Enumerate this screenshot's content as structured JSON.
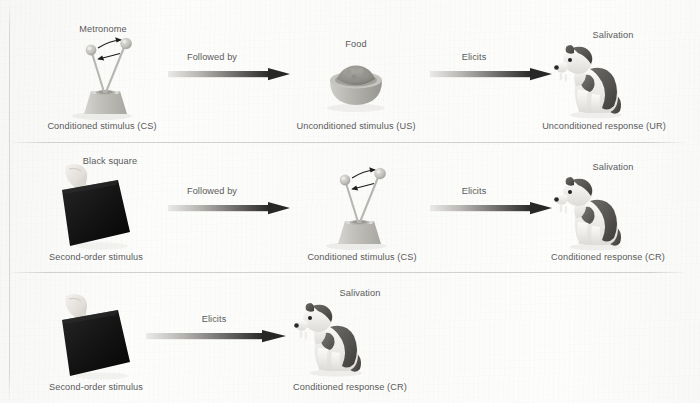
{
  "diagram": {
    "background_color": "#fdfdfc",
    "text_color": "#5a5a5a",
    "arrow_gradient": {
      "from": "#e8e8e6",
      "to": "#2b2b2b"
    }
  },
  "rows": [
    {
      "id": "row-1",
      "items": [
        {
          "name": "metronome",
          "top_label": "Metronome",
          "caption": "Conditioned stimulus (CS)"
        },
        {
          "name": "food-bowl",
          "top_label": "Food",
          "caption": "Unconditioned stimulus (US)"
        },
        {
          "name": "dog",
          "top_label": "Salivation",
          "caption": "Unconditioned response (UR)"
        }
      ],
      "arrows": [
        {
          "name": "arrow-followed-by",
          "label": "Followed by"
        },
        {
          "name": "arrow-elicits",
          "label": "Elicits"
        }
      ]
    },
    {
      "id": "row-2",
      "items": [
        {
          "name": "black-square",
          "top_label": "Black square",
          "caption": "Second-order stimulus"
        },
        {
          "name": "metronome",
          "top_label": "",
          "caption": "Conditioned stimulus (CS)"
        },
        {
          "name": "dog",
          "top_label": "Salivation",
          "caption": "Conditioned response (CR)"
        }
      ],
      "arrows": [
        {
          "name": "arrow-followed-by",
          "label": "Followed by"
        },
        {
          "name": "arrow-elicits",
          "label": "Elicits"
        }
      ]
    },
    {
      "id": "row-3",
      "items": [
        {
          "name": "black-square",
          "top_label": "",
          "caption": "Second-order stimulus"
        },
        {
          "name": "dog",
          "top_label": "Salivation",
          "caption": "Conditioned response (CR)"
        }
      ],
      "arrows": [
        {
          "name": "arrow-elicits",
          "label": "Elicits"
        }
      ]
    }
  ]
}
